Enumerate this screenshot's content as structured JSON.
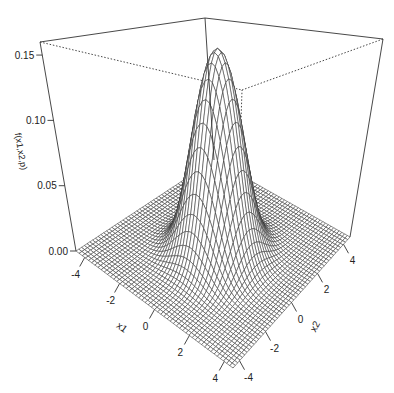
{
  "chart_data": {
    "type": "surface",
    "title": "",
    "function": "bivariate normal density f(x1,x2,p)",
    "xlabel": "x1",
    "ylabel": "x2",
    "zlabel": "f(x1,x2,p)",
    "x_range": [
      -4.5,
      4.5
    ],
    "y_range": [
      -4.5,
      4.5
    ],
    "zlim": [
      0,
      0.16
    ],
    "x_ticks": [
      "-4",
      "-2",
      "0",
      "2",
      "4"
    ],
    "y_ticks": [
      "-4",
      "-2",
      "0",
      "2",
      "4"
    ],
    "z_ticks": [
      "0.00",
      "0.05",
      "0.10",
      "0.15"
    ],
    "peak": {
      "x1": 0,
      "x2": 0,
      "z": 0.159
    },
    "correlation_p": 0,
    "grid": "wireframe",
    "box": true
  },
  "labels": {
    "x1": "x1",
    "x2": "x2",
    "z": "f(x1,x2,p)"
  }
}
